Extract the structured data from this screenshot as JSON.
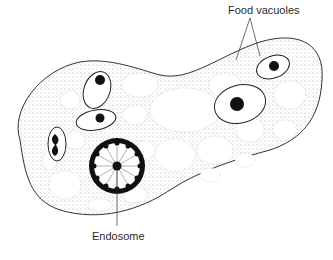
{
  "diagram": {
    "labels": {
      "food_vacuoles": "Food vacuoles",
      "endosome": "Endosome"
    }
  }
}
